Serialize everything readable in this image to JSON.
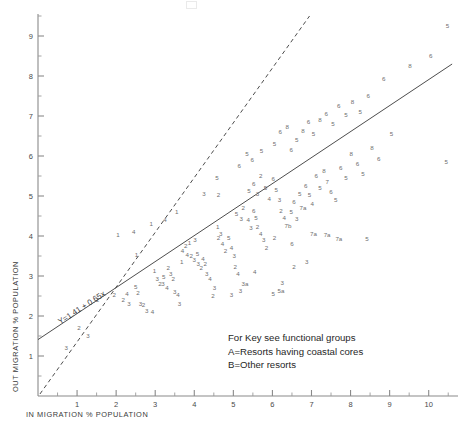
{
  "figure": {
    "corner_artifact": ""
  },
  "axes": {
    "x": {
      "title": "IN MIGRATION % POPULATION",
      "ticks": [
        1,
        2,
        3,
        4,
        5,
        6,
        7,
        8,
        9,
        10
      ],
      "minor_step": 0.5,
      "min": 0,
      "max": 10.75
    },
    "y": {
      "title": "OUT MIGRATION % POPULATION",
      "ticks": [
        1,
        2,
        3,
        4,
        5,
        6,
        7,
        8,
        9
      ],
      "minor_step": 0.5,
      "min": 0,
      "max": 9.55
    }
  },
  "regression": {
    "equation_label": "Y=1.41 + 0.65x",
    "intercept": 1.41,
    "slope": 0.65
  },
  "reference_line": {
    "intercept": 0,
    "slope": 1.12
  },
  "legend": {
    "line1": "For Key see functional groups",
    "line2": "A=Resorts having coastal cores",
    "line3": "B=Other resorts"
  },
  "chart_data": {
    "type": "scatter",
    "title": "",
    "xlabel": "IN MIGRATION % POPULATION",
    "ylabel": "OUT MIGRATION % POPULATION",
    "xlim": [
      0,
      10.75
    ],
    "ylim": [
      0,
      9.55
    ],
    "grid": false,
    "legend_position": "lower-right-inset",
    "point_style": "text-label",
    "annotations": [
      {
        "text": "Y=1.41 + 0.65x",
        "x": 0.55,
        "y": 1.95,
        "rotation": -33
      },
      {
        "text": "For Key see functional groups",
        "x": 5.4,
        "y": 1.55
      },
      {
        "text": "A=Resorts having coastal cores",
        "x": 5.4,
        "y": 1.2
      },
      {
        "text": "B=Other resorts",
        "x": 5.4,
        "y": 0.88
      }
    ],
    "lines": [
      {
        "name": "regression",
        "style": "solid",
        "x": [
          0,
          10.6
        ],
        "y": [
          1.41,
          8.3
        ]
      },
      {
        "name": "reference",
        "style": "dashed",
        "x": [
          0.05,
          6.95
        ],
        "y": [
          0.05,
          9.5
        ]
      }
    ],
    "points": [
      {
        "label": "3",
        "x": 0.72,
        "y": 1.18
      },
      {
        "label": "2",
        "x": 1.52,
        "y": 2.38
      },
      {
        "label": "2",
        "x": 1.95,
        "y": 2.52
      },
      {
        "label": "2",
        "x": 2.18,
        "y": 2.4
      },
      {
        "label": "4",
        "x": 2.28,
        "y": 2.55
      },
      {
        "label": "3",
        "x": 2.33,
        "y": 2.3
      },
      {
        "label": "5",
        "x": 2.5,
        "y": 2.72
      },
      {
        "label": "2",
        "x": 2.56,
        "y": 2.56
      },
      {
        "label": "3",
        "x": 2.62,
        "y": 2.3
      },
      {
        "label": "2",
        "x": 2.7,
        "y": 2.26
      },
      {
        "label": "3",
        "x": 2.78,
        "y": 2.12
      },
      {
        "label": "4",
        "x": 2.93,
        "y": 2.1
      },
      {
        "label": "1",
        "x": 2.9,
        "y": 4.3
      },
      {
        "label": "1",
        "x": 2.52,
        "y": 3.52
      },
      {
        "label": "4",
        "x": 2.45,
        "y": 4.08
      },
      {
        "label": "1",
        "x": 2.98,
        "y": 3.12
      },
      {
        "label": "3",
        "x": 3.05,
        "y": 2.92
      },
      {
        "label": "2",
        "x": 3.12,
        "y": 2.8
      },
      {
        "label": "3",
        "x": 3.2,
        "y": 2.78
      },
      {
        "label": "5",
        "x": 3.22,
        "y": 2.97
      },
      {
        "label": "4",
        "x": 3.3,
        "y": 2.7
      },
      {
        "label": "2",
        "x": 3.33,
        "y": 3.18
      },
      {
        "label": "3",
        "x": 3.4,
        "y": 3.05
      },
      {
        "label": "2",
        "x": 3.46,
        "y": 2.92
      },
      {
        "label": "3",
        "x": 3.5,
        "y": 2.58
      },
      {
        "label": "4",
        "x": 3.58,
        "y": 2.52
      },
      {
        "label": "3",
        "x": 3.62,
        "y": 2.3
      },
      {
        "label": "1",
        "x": 3.68,
        "y": 3.35
      },
      {
        "label": "4",
        "x": 3.7,
        "y": 3.62
      },
      {
        "label": "2",
        "x": 3.78,
        "y": 3.75
      },
      {
        "label": "1",
        "x": 3.88,
        "y": 3.82
      },
      {
        "label": "3",
        "x": 4.02,
        "y": 3.88
      },
      {
        "label": "4",
        "x": 3.82,
        "y": 3.52
      },
      {
        "label": "2",
        "x": 3.92,
        "y": 3.48
      },
      {
        "label": "3",
        "x": 4.0,
        "y": 3.4
      },
      {
        "label": "5",
        "x": 4.08,
        "y": 3.55
      },
      {
        "label": "3",
        "x": 4.1,
        "y": 3.28
      },
      {
        "label": "2",
        "x": 4.18,
        "y": 3.2
      },
      {
        "label": "4",
        "x": 4.22,
        "y": 3.42
      },
      {
        "label": "2",
        "x": 4.28,
        "y": 3.3
      },
      {
        "label": "3",
        "x": 4.32,
        "y": 3.05
      },
      {
        "label": "4",
        "x": 4.4,
        "y": 2.92
      },
      {
        "label": "3",
        "x": 4.52,
        "y": 2.7
      },
      {
        "label": "1",
        "x": 4.6,
        "y": 4.22
      },
      {
        "label": "2",
        "x": 4.62,
        "y": 3.95
      },
      {
        "label": "3",
        "x": 4.68,
        "y": 4.05
      },
      {
        "label": "4",
        "x": 4.72,
        "y": 3.78
      },
      {
        "label": "2",
        "x": 4.8,
        "y": 3.62
      },
      {
        "label": "5",
        "x": 4.88,
        "y": 3.95
      },
      {
        "label": "4",
        "x": 4.95,
        "y": 3.7
      },
      {
        "label": "3",
        "x": 5.02,
        "y": 3.48
      },
      {
        "label": "2",
        "x": 5.05,
        "y": 3.22
      },
      {
        "label": "4",
        "x": 5.12,
        "y": 3.05
      },
      {
        "label": "3",
        "x": 5.18,
        "y": 2.62
      },
      {
        "label": "3a",
        "x": 5.3,
        "y": 2.8
      },
      {
        "label": "2",
        "x": 4.48,
        "y": 2.48
      },
      {
        "label": "3",
        "x": 4.95,
        "y": 2.52
      },
      {
        "label": "4",
        "x": 5.55,
        "y": 3.08
      },
      {
        "label": "5",
        "x": 5.08,
        "y": 4.55
      },
      {
        "label": "3",
        "x": 5.2,
        "y": 4.42
      },
      {
        "label": "2",
        "x": 5.25,
        "y": 4.7
      },
      {
        "label": "4",
        "x": 5.38,
        "y": 4.38
      },
      {
        "label": "3",
        "x": 5.45,
        "y": 4.18
      },
      {
        "label": "6",
        "x": 5.52,
        "y": 4.62
      },
      {
        "label": "5",
        "x": 5.58,
        "y": 4.45
      },
      {
        "label": "2",
        "x": 5.62,
        "y": 4.22
      },
      {
        "label": "4",
        "x": 5.7,
        "y": 4.05
      },
      {
        "label": "3",
        "x": 5.78,
        "y": 3.88
      },
      {
        "label": "2",
        "x": 5.85,
        "y": 3.7
      },
      {
        "label": "5",
        "x": 5.4,
        "y": 5.12
      },
      {
        "label": "6",
        "x": 5.52,
        "y": 5.3
      },
      {
        "label": "3",
        "x": 5.62,
        "y": 5.05
      },
      {
        "label": "2",
        "x": 5.7,
        "y": 5.48
      },
      {
        "label": "5",
        "x": 5.82,
        "y": 5.18
      },
      {
        "label": "4",
        "x": 5.92,
        "y": 4.92
      },
      {
        "label": "6",
        "x": 6.02,
        "y": 5.42
      },
      {
        "label": "5",
        "x": 6.1,
        "y": 5.15
      },
      {
        "label": "3",
        "x": 6.18,
        "y": 4.88
      },
      {
        "label": "2",
        "x": 6.22,
        "y": 4.62
      },
      {
        "label": "4",
        "x": 6.3,
        "y": 4.45
      },
      {
        "label": "7b",
        "x": 6.4,
        "y": 4.25
      },
      {
        "label": "5",
        "x": 6.48,
        "y": 4.6
      },
      {
        "label": "6",
        "x": 6.55,
        "y": 4.85
      },
      {
        "label": "3",
        "x": 6.62,
        "y": 4.42
      },
      {
        "label": "5",
        "x": 6.7,
        "y": 5.05
      },
      {
        "label": "7a",
        "x": 6.78,
        "y": 4.7
      },
      {
        "label": "6",
        "x": 6.85,
        "y": 5.25
      },
      {
        "label": "5",
        "x": 6.95,
        "y": 5.02
      },
      {
        "label": "4",
        "x": 7.02,
        "y": 4.78
      },
      {
        "label": "6",
        "x": 7.12,
        "y": 5.48
      },
      {
        "label": "5",
        "x": 7.22,
        "y": 5.2
      },
      {
        "label": "8",
        "x": 7.32,
        "y": 5.62
      },
      {
        "label": "7",
        "x": 7.4,
        "y": 5.35
      },
      {
        "label": "6",
        "x": 7.5,
        "y": 5.1
      },
      {
        "label": "5",
        "x": 7.62,
        "y": 4.88
      },
      {
        "label": "6",
        "x": 7.75,
        "y": 5.7
      },
      {
        "label": "5",
        "x": 7.88,
        "y": 5.45
      },
      {
        "label": "8",
        "x": 8.02,
        "y": 6.05
      },
      {
        "label": "6",
        "x": 8.18,
        "y": 5.8
      },
      {
        "label": "5",
        "x": 8.32,
        "y": 5.55
      },
      {
        "label": "8",
        "x": 8.55,
        "y": 6.18
      },
      {
        "label": "6",
        "x": 8.72,
        "y": 5.92
      },
      {
        "label": "6",
        "x": 6.2,
        "y": 6.58
      },
      {
        "label": "8",
        "x": 6.38,
        "y": 6.72
      },
      {
        "label": "5",
        "x": 6.05,
        "y": 6.3
      },
      {
        "label": "6",
        "x": 6.48,
        "y": 6.15
      },
      {
        "label": "5",
        "x": 6.62,
        "y": 6.4
      },
      {
        "label": "8",
        "x": 6.78,
        "y": 6.62
      },
      {
        "label": "6",
        "x": 6.92,
        "y": 6.85
      },
      {
        "label": "5",
        "x": 7.05,
        "y": 6.55
      },
      {
        "label": "8",
        "x": 7.22,
        "y": 6.9
      },
      {
        "label": "6",
        "x": 7.38,
        "y": 7.05
      },
      {
        "label": "5",
        "x": 7.55,
        "y": 6.8
      },
      {
        "label": "6",
        "x": 7.7,
        "y": 7.25
      },
      {
        "label": "5",
        "x": 7.88,
        "y": 7.02
      },
      {
        "label": "8",
        "x": 8.05,
        "y": 7.35
      },
      {
        "label": "5",
        "x": 8.25,
        "y": 7.08
      },
      {
        "label": "6",
        "x": 8.45,
        "y": 7.48
      },
      {
        "label": "5",
        "x": 5.35,
        "y": 6.05
      },
      {
        "label": "5",
        "x": 5.72,
        "y": 6.12
      },
      {
        "label": "6",
        "x": 5.48,
        "y": 5.88
      },
      {
        "label": "5",
        "x": 4.58,
        "y": 5.45
      },
      {
        "label": "3",
        "x": 4.25,
        "y": 5.05
      },
      {
        "label": "2",
        "x": 4.62,
        "y": 5.02
      },
      {
        "label": "1",
        "x": 3.55,
        "y": 4.58
      },
      {
        "label": "4",
        "x": 3.25,
        "y": 4.4
      },
      {
        "label": "1",
        "x": 2.05,
        "y": 4.02
      },
      {
        "label": "6",
        "x": 5.15,
        "y": 5.75
      },
      {
        "label": "2",
        "x": 6.05,
        "y": 3.95
      },
      {
        "label": "6",
        "x": 6.5,
        "y": 3.78
      },
      {
        "label": "7a",
        "x": 7.05,
        "y": 4.05
      },
      {
        "label": "7a",
        "x": 7.4,
        "y": 4.02
      },
      {
        "label": "7a",
        "x": 7.7,
        "y": 3.92
      },
      {
        "label": "5",
        "x": 8.42,
        "y": 3.92
      },
      {
        "label": "3",
        "x": 6.88,
        "y": 3.35
      },
      {
        "label": "2",
        "x": 6.55,
        "y": 3.22
      },
      {
        "label": "5",
        "x": 6.02,
        "y": 2.55
      },
      {
        "label": "3",
        "x": 6.25,
        "y": 2.82
      },
      {
        "label": "5a",
        "x": 6.22,
        "y": 2.62
      },
      {
        "label": "5",
        "x": 9.05,
        "y": 6.55
      },
      {
        "label": "6",
        "x": 10.05,
        "y": 8.48
      },
      {
        "label": "5",
        "x": 10.48,
        "y": 9.25
      },
      {
        "label": "5",
        "x": 10.45,
        "y": 5.85
      },
      {
        "label": "8",
        "x": 9.52,
        "y": 8.25
      },
      {
        "label": "6",
        "x": 8.85,
        "y": 7.92
      },
      {
        "label": "2",
        "x": 1.05,
        "y": 1.68
      },
      {
        "label": "3",
        "x": 1.28,
        "y": 1.48
      }
    ]
  }
}
